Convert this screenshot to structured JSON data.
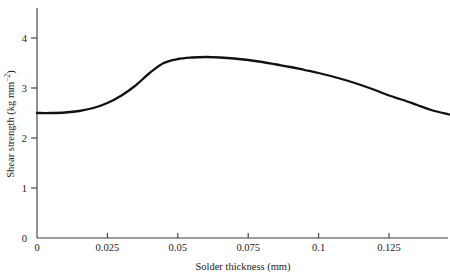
{
  "chart_data": {
    "type": "line",
    "title": "",
    "xlabel": "Solder thickness (mm)",
    "ylabel": "Shear strength (kg mm",
    "ylabel_sup": "−2",
    "ylabel_close": ")",
    "xlim": [
      0,
      0.1464
    ],
    "ylim": [
      0,
      4.4
    ],
    "xticks": [
      0,
      0.025,
      0.05,
      0.075,
      0.1,
      0.125
    ],
    "xtick_labels": [
      "0",
      "0.025",
      "0.05",
      "0.075",
      "0.1",
      "0.125"
    ],
    "yticks": [
      0,
      1,
      2,
      3,
      4
    ],
    "ytick_labels": [
      "0",
      "1",
      "2",
      "3",
      "4"
    ],
    "grid": false,
    "legend": "none",
    "series": [
      {
        "name": "shear strength",
        "x": [
          0.0,
          0.005,
          0.01,
          0.015,
          0.02,
          0.025,
          0.03,
          0.035,
          0.04,
          0.045,
          0.05,
          0.055,
          0.06,
          0.065,
          0.07,
          0.075,
          0.08,
          0.085,
          0.09,
          0.095,
          0.1,
          0.105,
          0.11,
          0.115,
          0.12,
          0.125,
          0.13,
          0.135,
          0.14,
          0.1464
        ],
        "values": [
          2.5,
          2.5,
          2.51,
          2.54,
          2.6,
          2.7,
          2.85,
          3.05,
          3.3,
          3.5,
          3.58,
          3.61,
          3.62,
          3.61,
          3.59,
          3.56,
          3.52,
          3.47,
          3.42,
          3.36,
          3.3,
          3.23,
          3.15,
          3.06,
          2.96,
          2.85,
          2.76,
          2.66,
          2.56,
          2.47
        ]
      }
    ]
  },
  "axes": {
    "x_axis_name": "x-axis",
    "y_axis_name": "y-axis"
  }
}
